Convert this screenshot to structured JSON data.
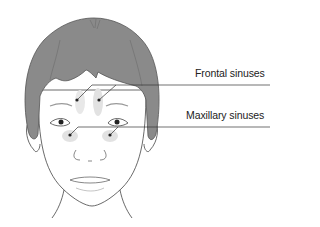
{
  "diagram": {
    "labels": [
      {
        "id": "frontal",
        "text": "Frontal sinuses"
      },
      {
        "id": "maxillary",
        "text": "Maxillary sinuses"
      }
    ],
    "colors": {
      "hair": "#8a8a8a",
      "outline": "#444444",
      "sinus_shade": "#e2e2e2",
      "leader_line": "#333333"
    }
  }
}
